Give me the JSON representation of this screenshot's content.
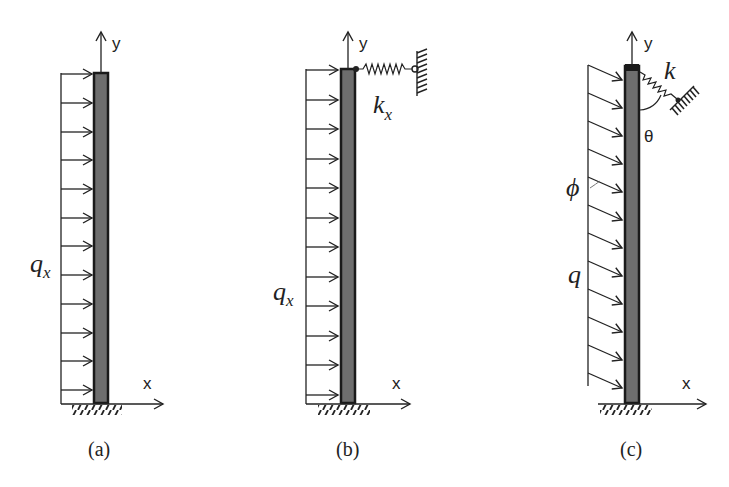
{
  "figure": {
    "panels": [
      {
        "id": "a",
        "caption": "(a)",
        "load_label": "q",
        "load_subscript": "x",
        "x_axis_label": "x",
        "y_axis_label": "y",
        "load_type": "uniform horizontal distributed load",
        "support_top": "none",
        "arrow_count": 12
      },
      {
        "id": "b",
        "caption": "(b)",
        "load_label": "q",
        "load_subscript": "x",
        "x_axis_label": "x",
        "y_axis_label": "y",
        "spring_label": "k",
        "spring_subscript": "x",
        "load_type": "uniform horizontal distributed load",
        "support_top": "horizontal spring to wall",
        "arrow_count": 12
      },
      {
        "id": "c",
        "caption": "(c)",
        "load_label": "q",
        "angle_label": "ϕ",
        "spring_label": "k",
        "spring_angle_label": "θ",
        "x_axis_label": "x",
        "y_axis_label": "y",
        "load_type": "uniform inclined distributed load",
        "support_top": "inclined spring to wall",
        "arrow_count": 12
      }
    ],
    "colors": {
      "line": "#222222",
      "column_fill": "#6e6e6e",
      "background": "#ffffff"
    }
  }
}
